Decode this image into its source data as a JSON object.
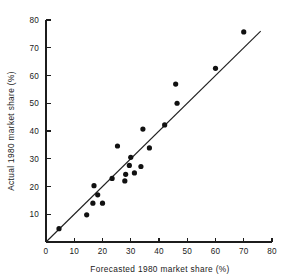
{
  "chart_data": {
    "type": "scatter",
    "title": "",
    "xlabel": "Forecasted 1980 market share (%)",
    "ylabel": "Actual 1980 market share (%)",
    "xlim": [
      0,
      80
    ],
    "ylim": [
      0,
      80
    ],
    "xticks": [
      0,
      10,
      20,
      30,
      40,
      50,
      60,
      70,
      80
    ],
    "yticks": [
      0,
      10,
      20,
      30,
      40,
      50,
      60,
      70,
      80
    ],
    "xtick_labels": [
      "0",
      "10",
      "20",
      "30",
      "40",
      "50",
      "60",
      "70",
      "80"
    ],
    "ytick_labels": [
      "0",
      "10",
      "20",
      "30",
      "40",
      "50",
      "60",
      "70",
      "80"
    ],
    "grid": false,
    "legend": "none",
    "marker": "filled-circle",
    "marker_color": "#111111",
    "points": [
      {
        "x": 4.6,
        "y": 4.8
      },
      {
        "x": 14.4,
        "y": 9.8
      },
      {
        "x": 16.6,
        "y": 14.0
      },
      {
        "x": 17.0,
        "y": 20.3
      },
      {
        "x": 18.3,
        "y": 17.0
      },
      {
        "x": 20.0,
        "y": 14.0
      },
      {
        "x": 23.4,
        "y": 22.9
      },
      {
        "x": 25.3,
        "y": 34.6
      },
      {
        "x": 27.9,
        "y": 22.0
      },
      {
        "x": 28.2,
        "y": 24.4
      },
      {
        "x": 29.5,
        "y": 27.6
      },
      {
        "x": 30.0,
        "y": 30.5
      },
      {
        "x": 31.3,
        "y": 24.9
      },
      {
        "x": 33.6,
        "y": 27.2
      },
      {
        "x": 34.3,
        "y": 40.7
      },
      {
        "x": 36.6,
        "y": 33.9
      },
      {
        "x": 42.0,
        "y": 42.2
      },
      {
        "x": 45.9,
        "y": 56.9
      },
      {
        "x": 46.4,
        "y": 50.0
      },
      {
        "x": 60.0,
        "y": 62.6
      },
      {
        "x": 70.0,
        "y": 75.7
      }
    ],
    "reference_line": {
      "name": "identity-line",
      "from": [
        0,
        0
      ],
      "to": [
        76,
        76
      ],
      "color": "#202020"
    }
  }
}
